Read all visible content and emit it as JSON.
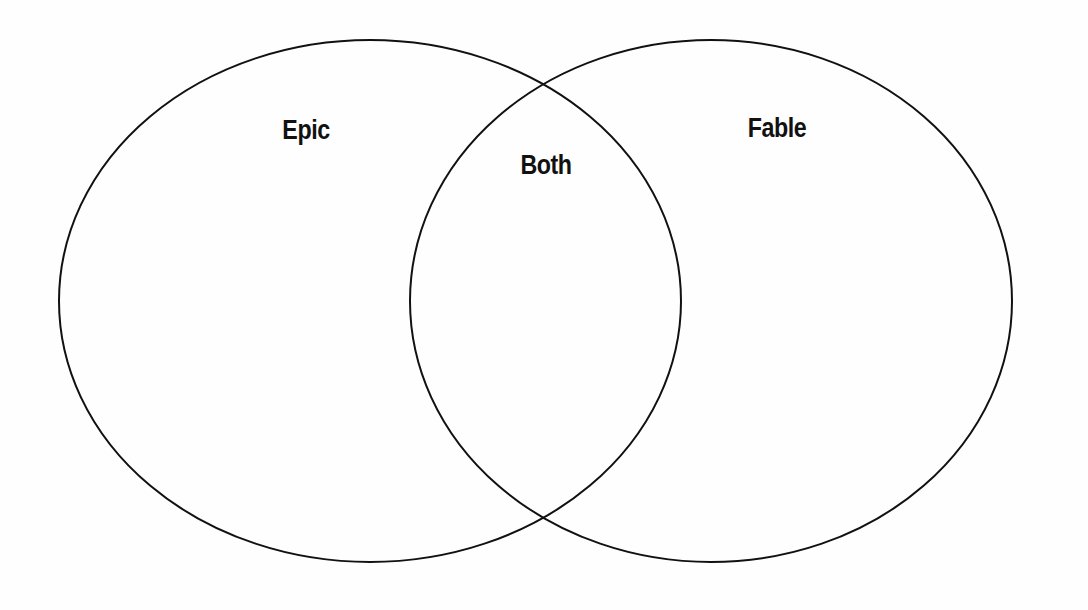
{
  "diagram": {
    "type": "venn",
    "sets": [
      {
        "id": "left",
        "label": "Epic"
      },
      {
        "id": "right",
        "label": "Fable"
      }
    ],
    "intersection": {
      "label": "Both"
    },
    "colors": {
      "outline": "#111111",
      "background": "#fefefe",
      "text": "#111111"
    }
  }
}
